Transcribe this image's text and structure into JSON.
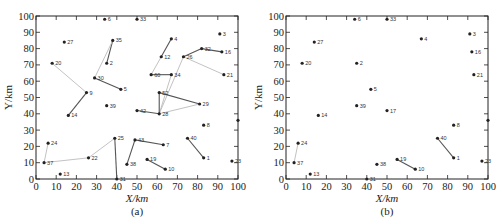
{
  "figure": {
    "panels": [
      {
        "id": "a",
        "caption": "(a)",
        "xlabel": "X/km",
        "ylabel": "Y/km"
      },
      {
        "id": "b",
        "caption": "(b)",
        "xlabel": "X/km",
        "ylabel": "Y/km"
      }
    ],
    "x_ticks": [
      "0",
      "10",
      "20",
      "30",
      "40",
      "50",
      "60",
      "70",
      "80",
      "90",
      "100"
    ],
    "y_ticks": [
      "0",
      "10",
      "20",
      "30",
      "40",
      "50",
      "60",
      "70",
      "80",
      "90",
      "100"
    ],
    "colors": {
      "node": "#222222",
      "edge_dark": "#555555",
      "edge_light": "#bbbbbb",
      "axis": "#222222"
    }
  },
  "chart_data": [
    {
      "type": "scatter",
      "title": "(a)",
      "xlabel": "X/km",
      "ylabel": "Y/km",
      "xlim": [
        0,
        100
      ],
      "ylim": [
        0,
        100
      ],
      "grid": false,
      "nodes": [
        {
          "id": "6",
          "x": 34,
          "y": 98
        },
        {
          "id": "33",
          "x": 50,
          "y": 98
        },
        {
          "id": "27",
          "x": 14,
          "y": 84
        },
        {
          "id": "35",
          "x": 38,
          "y": 85
        },
        {
          "id": "2",
          "x": 35,
          "y": 71
        },
        {
          "id": "20",
          "x": 8,
          "y": 71
        },
        {
          "id": "4",
          "x": 67,
          "y": 86
        },
        {
          "id": "3",
          "x": 91,
          "y": 89
        },
        {
          "id": "12",
          "x": 62,
          "y": 75
        },
        {
          "id": "32",
          "x": 82,
          "y": 80
        },
        {
          "id": "16",
          "x": 92,
          "y": 78
        },
        {
          "id": "26",
          "x": 73,
          "y": 75
        },
        {
          "id": "30",
          "x": 29,
          "y": 62
        },
        {
          "id": "60",
          "x": 57,
          "y": 64
        },
        {
          "id": "34",
          "x": 67,
          "y": 64
        },
        {
          "id": "21",
          "x": 93,
          "y": 64
        },
        {
          "id": "9",
          "x": 25,
          "y": 53
        },
        {
          "id": "5",
          "x": 42,
          "y": 55
        },
        {
          "id": "52",
          "x": 61,
          "y": 53
        },
        {
          "id": "29",
          "x": 81,
          "y": 46
        },
        {
          "id": "39",
          "x": 35,
          "y": 45
        },
        {
          "id": "14",
          "x": 16,
          "y": 39
        },
        {
          "id": "42",
          "x": 50,
          "y": 42
        },
        {
          "id": "28",
          "x": 61,
          "y": 40
        },
        {
          "id": "8",
          "x": 83,
          "y": 33
        },
        {
          "id": "E",
          "x": 100,
          "y": 36
        },
        {
          "id": "25",
          "x": 39,
          "y": 25
        },
        {
          "id": "43",
          "x": 49,
          "y": 24
        },
        {
          "id": "7",
          "x": 63,
          "y": 21
        },
        {
          "id": "40",
          "x": 75,
          "y": 25
        },
        {
          "id": "24",
          "x": 6,
          "y": 22
        },
        {
          "id": "22",
          "x": 26,
          "y": 13
        },
        {
          "id": "37",
          "x": 4,
          "y": 10
        },
        {
          "id": "38",
          "x": 45,
          "y": 9
        },
        {
          "id": "19",
          "x": 55,
          "y": 12
        },
        {
          "id": "1",
          "x": 83,
          "y": 13
        },
        {
          "id": "10",
          "x": 64,
          "y": 6
        },
        {
          "id": "23",
          "x": 97,
          "y": 11
        },
        {
          "id": "13",
          "x": 12,
          "y": 3
        },
        {
          "id": "31",
          "x": 40,
          "y": 0
        }
      ],
      "edges": [
        {
          "from": "35",
          "to": "2",
          "tone": "dark"
        },
        {
          "from": "35",
          "to": "30",
          "tone": "light"
        },
        {
          "from": "30",
          "to": "5",
          "tone": "dark"
        },
        {
          "from": "20",
          "to": "9",
          "tone": "light"
        },
        {
          "from": "9",
          "to": "14",
          "tone": "dark"
        },
        {
          "from": "4",
          "to": "12",
          "tone": "dark"
        },
        {
          "from": "12",
          "to": "60",
          "tone": "light"
        },
        {
          "from": "60",
          "to": "34",
          "tone": "dark"
        },
        {
          "from": "26",
          "to": "32",
          "tone": "dark"
        },
        {
          "from": "32",
          "to": "16",
          "tone": "dark"
        },
        {
          "from": "26",
          "to": "21",
          "tone": "light"
        },
        {
          "from": "26",
          "to": "28",
          "tone": "light"
        },
        {
          "from": "34",
          "to": "28",
          "tone": "light"
        },
        {
          "from": "52",
          "to": "28",
          "tone": "dark"
        },
        {
          "from": "52",
          "to": "29",
          "tone": "dark"
        },
        {
          "from": "29",
          "to": "28",
          "tone": "light"
        },
        {
          "from": "42",
          "to": "28",
          "tone": "dark"
        },
        {
          "from": "25",
          "to": "22",
          "tone": "light"
        },
        {
          "from": "25",
          "to": "31",
          "tone": "dark"
        },
        {
          "from": "43",
          "to": "38",
          "tone": "dark"
        },
        {
          "from": "43",
          "to": "7",
          "tone": "dark"
        },
        {
          "from": "40",
          "to": "1",
          "tone": "dark"
        },
        {
          "from": "19",
          "to": "10",
          "tone": "dark"
        },
        {
          "from": "24",
          "to": "37",
          "tone": "light"
        },
        {
          "from": "37",
          "to": "22",
          "tone": "light"
        }
      ]
    },
    {
      "type": "scatter",
      "title": "(b)",
      "xlabel": "X/km",
      "ylabel": "Y/km",
      "xlim": [
        0,
        100
      ],
      "ylim": [
        0,
        100
      ],
      "grid": false,
      "nodes": [
        {
          "id": "6",
          "x": 34,
          "y": 98
        },
        {
          "id": "33",
          "x": 50,
          "y": 98
        },
        {
          "id": "27",
          "x": 14,
          "y": 84
        },
        {
          "id": "2",
          "x": 35,
          "y": 71
        },
        {
          "id": "20",
          "x": 8,
          "y": 71
        },
        {
          "id": "4",
          "x": 67,
          "y": 86
        },
        {
          "id": "3",
          "x": 91,
          "y": 89
        },
        {
          "id": "16",
          "x": 92,
          "y": 78
        },
        {
          "id": "21",
          "x": 93,
          "y": 64
        },
        {
          "id": "5",
          "x": 42,
          "y": 55
        },
        {
          "id": "39",
          "x": 35,
          "y": 45
        },
        {
          "id": "17",
          "x": 50,
          "y": 42
        },
        {
          "id": "14",
          "x": 16,
          "y": 39
        },
        {
          "id": "8",
          "x": 83,
          "y": 33
        },
        {
          "id": "E",
          "x": 100,
          "y": 36
        },
        {
          "id": "40",
          "x": 75,
          "y": 25
        },
        {
          "id": "24",
          "x": 6,
          "y": 22
        },
        {
          "id": "37",
          "x": 4,
          "y": 10
        },
        {
          "id": "38",
          "x": 45,
          "y": 9
        },
        {
          "id": "19",
          "x": 55,
          "y": 12
        },
        {
          "id": "1",
          "x": 83,
          "y": 13
        },
        {
          "id": "10",
          "x": 64,
          "y": 6
        },
        {
          "id": "23",
          "x": 97,
          "y": 11
        },
        {
          "id": "13",
          "x": 12,
          "y": 3
        },
        {
          "id": "31",
          "x": 40,
          "y": 0
        }
      ],
      "edges": [
        {
          "from": "24",
          "to": "37",
          "tone": "light"
        },
        {
          "from": "19",
          "to": "10",
          "tone": "dark"
        },
        {
          "from": "40",
          "to": "1",
          "tone": "dark"
        }
      ]
    }
  ]
}
